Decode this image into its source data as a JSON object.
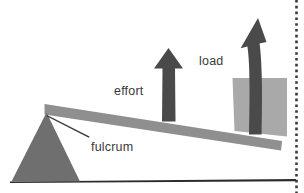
{
  "figure": {
    "name": "lever-mechanical-advantage-diagram",
    "type": "diagram",
    "background_color": "#ffffff",
    "width": 304,
    "height": 193
  },
  "labels": {
    "effort": "effort",
    "load": "load",
    "fulcrum": "fulcrum"
  },
  "colors": {
    "fulcrum_fill": "#6f6f6f",
    "lever_fill": "#8f8f8f",
    "load_block_fill": "#a9a9a9",
    "arrow_fill": "#4a4a4a",
    "ground_line": "#2b2b2b",
    "leader_line": "#3a3a3a",
    "label_text": "#3a3a3a",
    "page_edge_dots": "#3a3a3a"
  },
  "elements": {
    "fulcrum_triangle": "triangular pivot support at lower left",
    "lever_bar": "tapered bar sloping upward from left pivot to right end",
    "effort_arrow": "straight arrow pointing up from middle of lever",
    "load_arrow": "curved arrow pointing up through the load block",
    "load_block": "light gray rectangular block resting on right end of lever",
    "ground_line": "thin horizontal ground rule",
    "fulcrum_leader_line": "leader line from fulcrum label to pivot apex",
    "page_edge_dotted_rule": "vertical dotted rule at right page edge"
  }
}
